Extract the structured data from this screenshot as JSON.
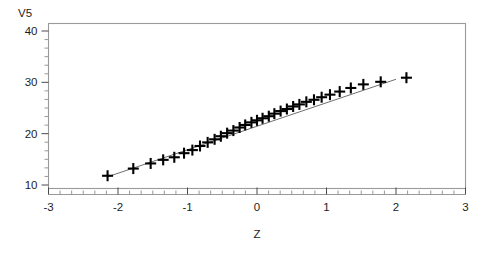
{
  "chart_data": {
    "type": "scatter",
    "title": "",
    "subtitle": "",
    "xlabel": "Z",
    "ylabel": "V5",
    "xlim": [
      -3,
      3
    ],
    "ylim": [
      10,
      40
    ],
    "grid": false,
    "legend": null,
    "marker_style": "plus",
    "x_ticks": [
      -3,
      -2,
      -1,
      0,
      1,
      2,
      3
    ],
    "x_tick_labels": [
      "-3",
      "-2",
      "-1",
      "0",
      "1",
      "2",
      "3"
    ],
    "y_ticks": [
      10,
      20,
      30,
      40
    ],
    "y_tick_labels": [
      "10",
      "20",
      "30",
      "40"
    ],
    "x_minor_tick_count": 5,
    "y_minor_tick_count": 5,
    "series": [
      {
        "name": "observations",
        "x": [
          -2.15,
          -1.78,
          -1.53,
          -1.35,
          -1.19,
          -1.05,
          -0.93,
          -0.82,
          -0.71,
          -0.61,
          -0.52,
          -0.43,
          -0.34,
          -0.25,
          -0.17,
          -0.08,
          0.0,
          0.08,
          0.17,
          0.25,
          0.34,
          0.43,
          0.52,
          0.61,
          0.71,
          0.82,
          0.93,
          1.05,
          1.19,
          1.35,
          1.53,
          1.78,
          2.15
        ],
        "y": [
          11.8,
          13.2,
          14.2,
          14.9,
          15.4,
          16.2,
          16.8,
          17.6,
          18.3,
          18.9,
          19.5,
          20.1,
          20.6,
          21.2,
          21.7,
          22.2,
          22.6,
          23.0,
          23.4,
          23.9,
          24.4,
          24.8,
          25.3,
          25.7,
          26.2,
          26.6,
          27.1,
          27.6,
          28.2,
          28.9,
          29.6,
          30.1,
          30.9
        ]
      }
    ],
    "reference_line": {
      "name": "normal-fit-line",
      "x": [
        -2.15,
        2.0
      ],
      "y": [
        11.6,
        30.6
      ]
    }
  }
}
